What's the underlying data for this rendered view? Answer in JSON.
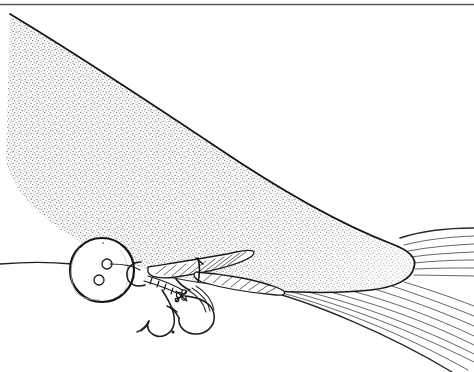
{
  "canvas": {
    "width": 474,
    "height": 372,
    "background": "#ffffff",
    "medium": "pen-and-ink stipple line drawing",
    "subject": "Fish snout approaching an artificial fishing fly at the water surface"
  },
  "palette": {
    "ink": "#1a1a1a",
    "ink_soft": "#3a3a3a",
    "stipple_dot": "#777777",
    "streamline": "#4a4a4a",
    "paper": "#ffffff"
  },
  "elements": {
    "top_rule": {
      "name": "top border rule",
      "y": 4,
      "x_start": 0,
      "x_end": 474,
      "stroke_width": 1.4,
      "color": "#5a5a5a"
    },
    "fish_body": {
      "name": "stippled fish snout",
      "description": "Large wedge-shaped fish head, stippled shading, rounded nose at right",
      "outline_color": "#1a1a1a",
      "fill": "stipple",
      "nose_x": 414,
      "nose_y": 268
    },
    "surface_line": {
      "name": "water surface / leader line",
      "y": 263,
      "x_start": 0,
      "x_end": 120
    },
    "bubble": {
      "name": "air bubble / strike indicator disc",
      "cx": 102,
      "cy": 270,
      "r": 32,
      "inner_dots": 2
    },
    "fly": {
      "name": "artificial fishing fly",
      "wing_count": 2,
      "hook_count": 2,
      "hackle_wraps": 5,
      "description": "Streamer fly with two hatched feather wings, wrapped body segments and two hook bends with barbs"
    },
    "streamlines": {
      "name": "water flow streamlines",
      "upper_count": 7,
      "lower_count": 9,
      "color": "#4a4a4a"
    }
  },
  "labels": {
    "title": "",
    "caption": "",
    "annotations": []
  }
}
